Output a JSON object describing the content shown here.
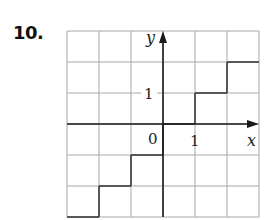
{
  "problem": {
    "number": "10."
  },
  "colors": {
    "grid": "#a8a8a8",
    "axis": "#1a1a1a",
    "step": "#3a3a3a"
  },
  "chart_data": {
    "type": "line",
    "subtype": "step-function",
    "title": "",
    "xlabel": "x",
    "ylabel": "y",
    "xlim": [
      -3,
      3
    ],
    "ylim": [
      -3,
      3
    ],
    "grid": true,
    "tick_labels": {
      "origin": "0",
      "x": [
        {
          "value": 1,
          "label": "1"
        }
      ],
      "y": [
        {
          "value": 1,
          "label": "1"
        }
      ]
    },
    "function": "floor(x)",
    "segments": [
      {
        "x": [
          -3,
          -2
        ],
        "y": -3
      },
      {
        "x": [
          -2,
          -1
        ],
        "y": -2
      },
      {
        "x": [
          -1,
          0
        ],
        "y": -1
      },
      {
        "x": [
          0,
          1
        ],
        "y": 0
      },
      {
        "x": [
          1,
          2
        ],
        "y": 1
      },
      {
        "x": [
          2,
          3
        ],
        "y": 2
      }
    ],
    "vertical_connectors": [
      {
        "x": -2,
        "y": [
          -3,
          -2
        ]
      },
      {
        "x": -1,
        "y": [
          -2,
          -1
        ]
      },
      {
        "x": 0,
        "y": [
          -1,
          0
        ]
      },
      {
        "x": 1,
        "y": [
          0,
          1
        ]
      },
      {
        "x": 2,
        "y": [
          1,
          2
        ]
      }
    ]
  }
}
